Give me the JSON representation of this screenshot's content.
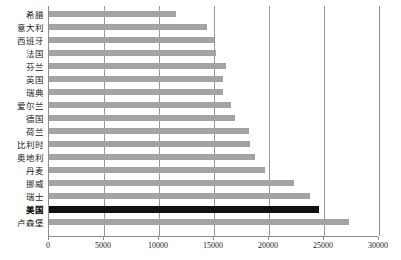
{
  "chart_data": {
    "type": "bar",
    "orientation": "horizontal",
    "title": "",
    "subtitle": "",
    "xlabel": "",
    "ylabel": "",
    "xlim": [
      0,
      30000
    ],
    "ylim": null,
    "grid": true,
    "legend": null,
    "legend_position": "none",
    "xticks": [
      0,
      5000,
      10000,
      15000,
      20000,
      25000,
      30000
    ],
    "xtick_labels": [
      "0",
      "5000",
      "10000",
      "15000",
      "20000",
      "25000",
      "30000"
    ],
    "categories": [
      "希腊",
      "意大利",
      "西班牙",
      "法国",
      "芬兰",
      "英国",
      "瑞典",
      "爱尔兰",
      "德国",
      "荷兰",
      "比利时",
      "奥地利",
      "丹麦",
      "挪威",
      "瑞士",
      "美国",
      "卢森堡"
    ],
    "values": [
      11500,
      14400,
      15000,
      15200,
      16100,
      15800,
      15800,
      16500,
      16900,
      18200,
      18300,
      18700,
      19600,
      22300,
      23700,
      24500,
      27300
    ],
    "highlight_category": "美国",
    "colors": {
      "bar": "#a3a3a3",
      "bar_highlight": "#111111",
      "gridline": "#9a9a9a",
      "axis": "#8c8c8c",
      "background": "#ffffff",
      "text": "#1a1a1a"
    }
  }
}
